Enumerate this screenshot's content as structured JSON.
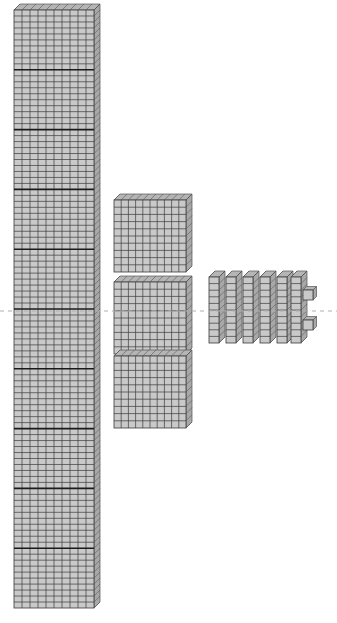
{
  "figure": {
    "type": "base-ten-blocks-diagram",
    "background_color": "#ffffff",
    "canvas": {
      "width": 337,
      "height": 623
    }
  },
  "style": {
    "block_face_color": "#c9c9c9",
    "block_face_color_light": "#d4d4d4",
    "grid_line_color": "#3b3b3b",
    "thick_divider_color": "#1a1a1a",
    "edge_color": "#555555",
    "top_face_color": "#b5b5b5",
    "side_face_color": "#a8a8a8",
    "reference_line_color": "#b0b0b0"
  },
  "reference_line": {
    "label": "dashed-centerline",
    "y": 311,
    "x_start": 0,
    "x_end": 337,
    "dash": "4 4",
    "color": "#b0b0b0"
  },
  "groups": [
    {
      "name": "thousands-column",
      "place_value": "thousands",
      "unit_name": "cube-stack",
      "count": 10,
      "value": 1000,
      "columns_of_units": 10,
      "rows_of_units": 100,
      "x": 14,
      "y": 10,
      "width": 80,
      "height": 598,
      "divider_rows": [
        10,
        20,
        30,
        40,
        50,
        60,
        70,
        80,
        90
      ]
    },
    {
      "name": "hundreds-flats",
      "place_value": "hundreds",
      "unit_name": "flat",
      "count": 3,
      "value": 300,
      "each_value": 100,
      "grid": "10x10",
      "x": 114,
      "width": 72,
      "height": 72,
      "items": [
        {
          "label": "flat-1",
          "y": 200
        },
        {
          "label": "flat-2",
          "y": 282
        },
        {
          "label": "flat-3",
          "y": 356
        }
      ]
    },
    {
      "name": "tens-rods",
      "place_value": "tens",
      "unit_name": "rod",
      "count": 6,
      "value": 60,
      "each_value": 10,
      "grid": "1x10",
      "y": 277,
      "width": 10,
      "height": 66,
      "items": [
        {
          "label": "rod-1",
          "x": 209
        },
        {
          "label": "rod-2",
          "x": 226
        },
        {
          "label": "rod-3",
          "x": 243
        },
        {
          "label": "rod-4",
          "x": 260
        },
        {
          "label": "rod-5",
          "x": 277
        },
        {
          "label": "rod-6",
          "x": 291
        }
      ]
    },
    {
      "name": "ones-cubes",
      "place_value": "ones",
      "unit_name": "unit-cube",
      "count": 2,
      "value": 2,
      "each_value": 1,
      "width": 10,
      "height": 10,
      "items": [
        {
          "label": "unit-cube-1",
          "x": 303,
          "y": 290
        },
        {
          "label": "unit-cube-2",
          "x": 303,
          "y": 320
        }
      ]
    }
  ],
  "chart_data": {
    "type": "bar",
    "categories": [
      "thousands",
      "hundreds",
      "tens",
      "ones"
    ],
    "values": [
      10,
      3,
      6,
      2
    ],
    "unit_values": [
      1000,
      100,
      10,
      1
    ],
    "xlabel": "place value",
    "ylabel": "number of blocks",
    "grid": false,
    "legend": "none"
  }
}
